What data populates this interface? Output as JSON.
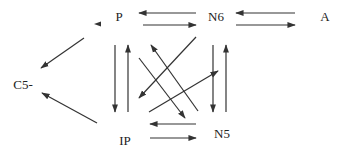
{
  "diagram": {
    "type": "reaction-network",
    "nodes": {
      "P": {
        "label": "P",
        "x": 119,
        "y": 15
      },
      "N6": {
        "label": "N6",
        "x": 216,
        "y": 15
      },
      "A": {
        "label": "A",
        "x": 325,
        "y": 15
      },
      "C5": {
        "label": "C5-",
        "x": 23,
        "y": 83
      },
      "IP": {
        "label": "IP",
        "x": 125,
        "y": 139
      },
      "N5": {
        "label": "N5",
        "x": 222,
        "y": 132
      }
    },
    "edges": [
      {
        "from": "N6",
        "to": "P"
      },
      {
        "from": "P",
        "to": "N6"
      },
      {
        "from": "A",
        "to": "N6"
      },
      {
        "from": "N6",
        "to": "A"
      },
      {
        "from": "P",
        "to": "C5-"
      },
      {
        "from": "IP",
        "to": "C5-"
      },
      {
        "from": "P",
        "to": "IP"
      },
      {
        "from": "IP",
        "to": "P"
      },
      {
        "from": "N6",
        "to": "N5"
      },
      {
        "from": "N5",
        "to": "N6"
      },
      {
        "from": "IP",
        "to": "N6"
      },
      {
        "from": "N6",
        "to": "IP"
      },
      {
        "from": "P",
        "to": "N5"
      },
      {
        "from": "N5",
        "to": "P"
      },
      {
        "from": "N5",
        "to": "IP"
      },
      {
        "from": "IP",
        "to": "N5"
      }
    ],
    "colors": {
      "line": "#333333",
      "text": "#222222",
      "background": "#ffffff"
    }
  }
}
